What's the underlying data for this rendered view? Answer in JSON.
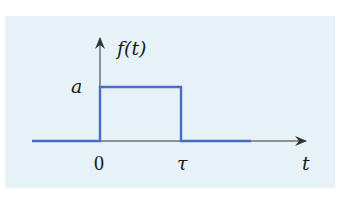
{
  "diagram": {
    "type": "rectangular-pulse",
    "background_color": "#e7f1f8",
    "pulse_color": "#4a6cc6",
    "axis_color": "#333333",
    "labels": {
      "y_axis": "f(t)",
      "x_axis": "t",
      "amplitude": "a",
      "origin": "0",
      "pulse_end": "τ"
    },
    "signal": {
      "description": "f(t) = a for 0 ≤ t ≤ τ, 0 otherwise",
      "points": [
        {
          "t": "-∞",
          "f": 0
        },
        {
          "t": "0",
          "f": 0
        },
        {
          "t": "0",
          "f": "a"
        },
        {
          "t": "τ",
          "f": "a"
        },
        {
          "t": "τ",
          "f": 0
        },
        {
          "t": "+",
          "f": 0
        }
      ]
    }
  }
}
